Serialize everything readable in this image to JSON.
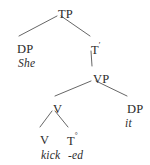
{
  "diagram": {
    "kind": "syntax-tree",
    "background_color": "#ffffff",
    "text_color": "#2b2b2b",
    "line_color": "#555555",
    "nodes": {
      "tp": {
        "label": "TP",
        "x": 58,
        "y": 8
      },
      "dp_subject": {
        "label": "DP",
        "x": 17,
        "y": 43
      },
      "she": {
        "label": "She",
        "x": 18,
        "y": 58
      },
      "t_bar_main": {
        "label": "T",
        "prime": "′",
        "x": 91,
        "y": 43
      },
      "vp": {
        "label": "VP",
        "x": 93,
        "y": 73
      },
      "v_upper": {
        "label": "V",
        "x": 53,
        "y": 103
      },
      "dp_object": {
        "label": "DP",
        "x": 127,
        "y": 103
      },
      "it": {
        "label": "it",
        "x": 125,
        "y": 118
      },
      "v_lower": {
        "label": "V",
        "x": 40,
        "y": 134
      },
      "t_zero": {
        "label": "T",
        "degree": "°",
        "x": 67,
        "y": 134
      },
      "kick": {
        "label": "kick",
        "x": 41,
        "y": 150
      },
      "ed": {
        "label": "-ed",
        "x": 68,
        "y": 150
      }
    },
    "edges": [
      {
        "name": "tp-to-dp-subject",
        "x1": 57,
        "y1": 16,
        "x2": 19,
        "y2": 36
      },
      {
        "name": "tp-to-t-bar",
        "x1": 61,
        "y1": 16,
        "x2": 90,
        "y2": 36
      },
      {
        "name": "t-bar-to-vp",
        "x1": 91,
        "y1": 51,
        "x2": 92,
        "y2": 66
      },
      {
        "name": "vp-to-v-upper",
        "x1": 91,
        "y1": 81,
        "x2": 55,
        "y2": 96
      },
      {
        "name": "vp-to-dp-object",
        "x1": 96,
        "y1": 81,
        "x2": 127,
        "y2": 96
      },
      {
        "name": "v-to-v-lower",
        "x1": 52,
        "y1": 111,
        "x2": 40,
        "y2": 127
      },
      {
        "name": "v-to-t-zero",
        "x1": 55,
        "y1": 111,
        "x2": 68,
        "y2": 127
      }
    ]
  }
}
